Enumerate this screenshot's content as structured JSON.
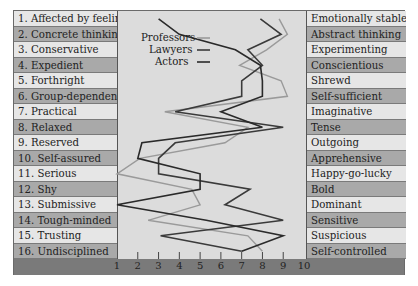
{
  "chart_data": {
    "type": "line",
    "title": "",
    "xlabel": "",
    "ylabel": "",
    "xlim": [
      1,
      10
    ],
    "x_ticks": [
      "1",
      "2",
      "3",
      "4",
      "5",
      "6",
      "7",
      "8",
      "9",
      "10"
    ],
    "left_labels": [
      "1. Affected by feelings",
      "2. Concrete thinking",
      "3. Conservative",
      "4. Expedient",
      "5. Forthright",
      "6. Group-dependent",
      "7. Practical",
      "8. Relaxed",
      "9. Reserved",
      "10. Self-assured",
      "11. Serious",
      "12. Shy",
      "13. Submissive",
      "14. Tough-minded",
      "15. Trusting",
      "16. Undisciplined"
    ],
    "right_labels": [
      "Emotionally stable",
      "Abstract thinking",
      "Experimenting",
      "Conscientious",
      "Shrewd",
      "Self-sufficient",
      "Imaginative",
      "Tense",
      "Outgoing",
      "Apprehensive",
      "Happy-go-lucky",
      "Bold",
      "Dominant",
      "Sensitive",
      "Suspicious",
      "Self-controlled"
    ],
    "series": [
      {
        "name": "Professors",
        "color": "#9a9a9a",
        "values": [
          8.8,
          9.2,
          8.2,
          6.9,
          8.9,
          9.2,
          3.3,
          7.3,
          6.2,
          2.1,
          1.0,
          4.6,
          5.0,
          2.5,
          7.3,
          8.0
        ]
      },
      {
        "name": "Lawyers",
        "color": "#3a3a3a",
        "values": [
          7.9,
          8.9,
          7.3,
          8.0,
          7.0,
          7.0,
          3.8,
          9.0,
          3.8,
          3.0,
          3.0,
          7.4,
          6.2,
          9.0,
          3.1,
          7.0
        ]
      },
      {
        "name": "Actors",
        "color": "#2a2a2a",
        "values": [
          3.0,
          4.0,
          6.7,
          7.9,
          8.0,
          8.0,
          6.0,
          8.0,
          2.2,
          2.0,
          5.0,
          5.0,
          1.0,
          5.3,
          9.0,
          7.0
        ]
      }
    ],
    "legend": [
      "Professors",
      "Lawyers",
      "Actors"
    ],
    "legend_position": "upper-left inside plot",
    "grid": false
  },
  "legend": {
    "professors": "Professors",
    "lawyers": "Lawyers",
    "actors": "Actors"
  }
}
